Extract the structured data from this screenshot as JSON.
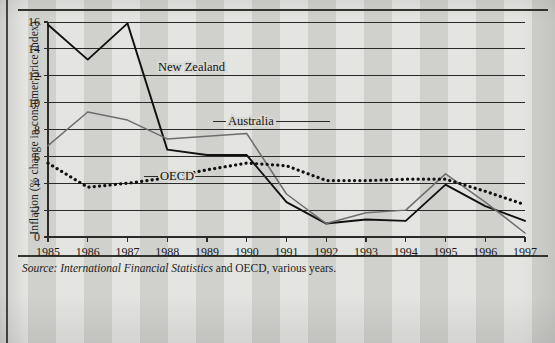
{
  "figure": {
    "y_axis_title": "Inflation (% change in consumer price index)",
    "source_lead": "Source:",
    "source_title": "International Financial Statistics",
    "source_rest": " and OECD, various years."
  },
  "labels": {
    "new_zealand": "New Zealand",
    "australia": "Australia",
    "oecd": "OECD"
  },
  "chart_data": {
    "type": "line",
    "title": "",
    "xlabel": "",
    "ylabel": "Inflation (% change in consumer price index)",
    "x": [
      1985,
      1986,
      1987,
      1988,
      1989,
      1990,
      1991,
      1992,
      1993,
      1994,
      1995,
      1996,
      1997
    ],
    "xtick_labels": [
      "1985",
      "1986",
      "1987",
      "1988",
      "1989",
      "1990",
      "1991",
      "1992",
      "1993",
      "1994",
      "1995",
      "1996",
      "1997"
    ],
    "ytick_labels": [
      "0",
      "2",
      "4",
      "6",
      "8",
      "10",
      "12",
      "14",
      "16"
    ],
    "yticks": [
      0,
      2,
      4,
      6,
      8,
      10,
      12,
      14,
      16
    ],
    "ylim": [
      0,
      16
    ],
    "xlim": [
      1985,
      1997
    ],
    "grid": "horizontal",
    "legend": "inline-labels",
    "series": [
      {
        "name": "New Zealand",
        "style": "solid",
        "color": "#111111",
        "width": 1.9,
        "values": [
          15.8,
          13.2,
          15.9,
          6.5,
          6.1,
          6.1,
          2.6,
          1.0,
          1.3,
          1.2,
          3.9,
          2.3,
          1.2
        ]
      },
      {
        "name": "Australia",
        "style": "solid",
        "color": "#6e6e6e",
        "width": 1.5,
        "values": [
          6.8,
          9.3,
          8.7,
          7.3,
          7.5,
          7.7,
          3.2,
          1.0,
          1.8,
          2.0,
          4.7,
          2.6,
          0.3
        ]
      },
      {
        "name": "OECD",
        "style": "dotted",
        "color": "#111111",
        "width": 3.2,
        "values": [
          5.5,
          3.7,
          4.0,
          4.4,
          5.0,
          5.5,
          5.3,
          4.2,
          4.2,
          4.3,
          4.3,
          3.4,
          2.4
        ]
      }
    ]
  }
}
